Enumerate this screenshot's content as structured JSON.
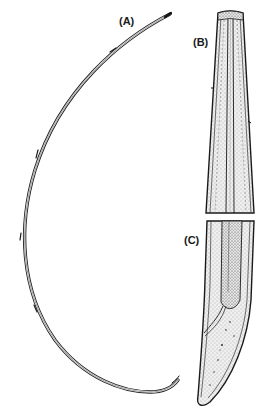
{
  "figure": {
    "panels": [
      {
        "id": "A",
        "label": "(A)",
        "content": "whole-worm"
      },
      {
        "id": "B",
        "label": "(B)",
        "content": "anterior-end"
      },
      {
        "id": "C",
        "label": "(C)",
        "content": "posterior-end"
      }
    ],
    "colors": {
      "ink": "#1a1a1a",
      "stipple": "#555555",
      "background": "#ffffff",
      "body_fill": "#f1f1f1"
    }
  }
}
